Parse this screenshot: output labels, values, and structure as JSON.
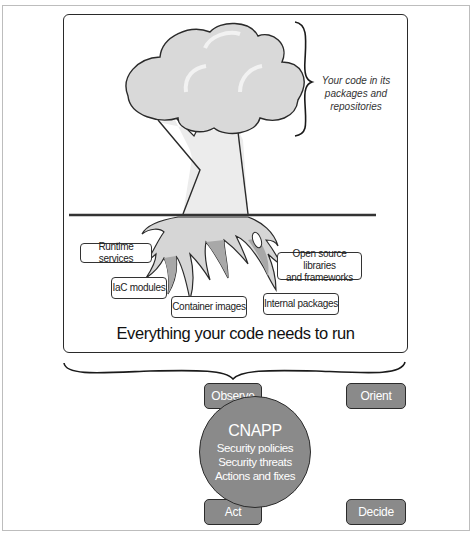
{
  "diagram": {
    "upper_section": {
      "code_label": "Your code in its packages and repositories",
      "code_label_lines": [
        "Your code in its",
        "packages and repositories"
      ],
      "dependency_tags": [
        {
          "id": "runtime-services",
          "label": "Runtime services"
        },
        {
          "id": "iac-modules",
          "label": "IaC modules"
        },
        {
          "id": "container-images",
          "label": "Container images"
        },
        {
          "id": "open-source",
          "label_lines": [
            "Open source libraries",
            "and frameworks"
          ]
        },
        {
          "id": "internal-packages",
          "label": "Internal packages"
        }
      ],
      "caption": "Everything your code needs to run"
    },
    "ooda_loop": {
      "steps": [
        {
          "id": "observe",
          "label": "Observe"
        },
        {
          "id": "orient",
          "label": "Orient"
        },
        {
          "id": "decide",
          "label": "Decide"
        },
        {
          "id": "act",
          "label": "Act"
        }
      ],
      "center": {
        "title": "CNAPP",
        "lines": [
          "Security policies",
          "Security threats",
          "Actions and fixes"
        ]
      }
    },
    "colors": {
      "canopy": "#d9d9d9",
      "trunk": "#ececec",
      "roots_light": "#d6d6d6",
      "roots_dark": "#a8a8a8",
      "ooda_fill": "#8a8a8a",
      "stroke": "#2a2a2a"
    }
  }
}
